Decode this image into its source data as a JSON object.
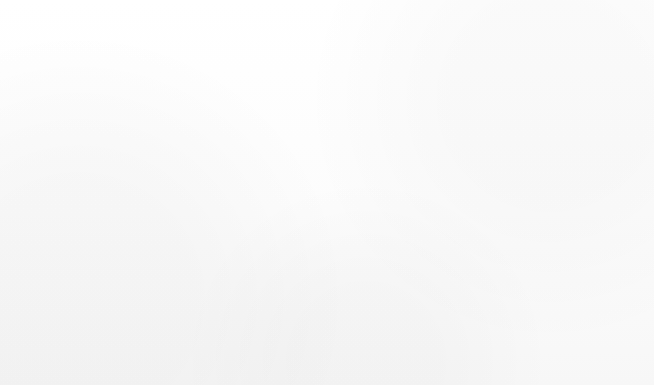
{
  "chart_data": {
    "type": "bar",
    "orientation": "horizontal",
    "title": "",
    "subtitle": "",
    "xlabel": "",
    "ylabel": "",
    "categories": [
      "Total, All Occupations",
      "Agricultural Workers",
      "Farming, Fishing, and\nForestry Occupations"
    ],
    "values": [
      11,
      -3,
      -3
    ],
    "value_labels": [
      "11%",
      "-3%",
      "-3%"
    ],
    "bar_colors": [
      "#8e8e8e",
      "#161616",
      "#8d8d8d"
    ],
    "xlim": [
      -4,
      12
    ],
    "units": "percent",
    "grid": false,
    "legend": null,
    "zero_axis": true,
    "annotations": [
      "Note: All Occupations includes all occupations in the U.S. economy.",
      "Source: U.S. Bureau of Labor Statistics, Employment Projections program"
    ]
  },
  "bars": [
    {
      "label": "Total, All Occupations",
      "value_label": "11%"
    },
    {
      "label": "Agricultural Workers",
      "value_label": "-3%"
    },
    {
      "label": "Farming, Fishing, and\nForestry Occupations",
      "value_label": "-3%"
    }
  ],
  "footnotes": {
    "note": "Note: All Occupations includes all occupations in the U.S. economy.",
    "source": "Source: U.S. Bureau of Labor Statistics, Employment Projections program"
  },
  "colors": {
    "bar_gray": "#8e8e8e",
    "bar_black": "#161616",
    "axis": "#3a3a3a",
    "frame": "#303030",
    "value_text": "#ffffff",
    "label_text": "#1b1b1b"
  }
}
